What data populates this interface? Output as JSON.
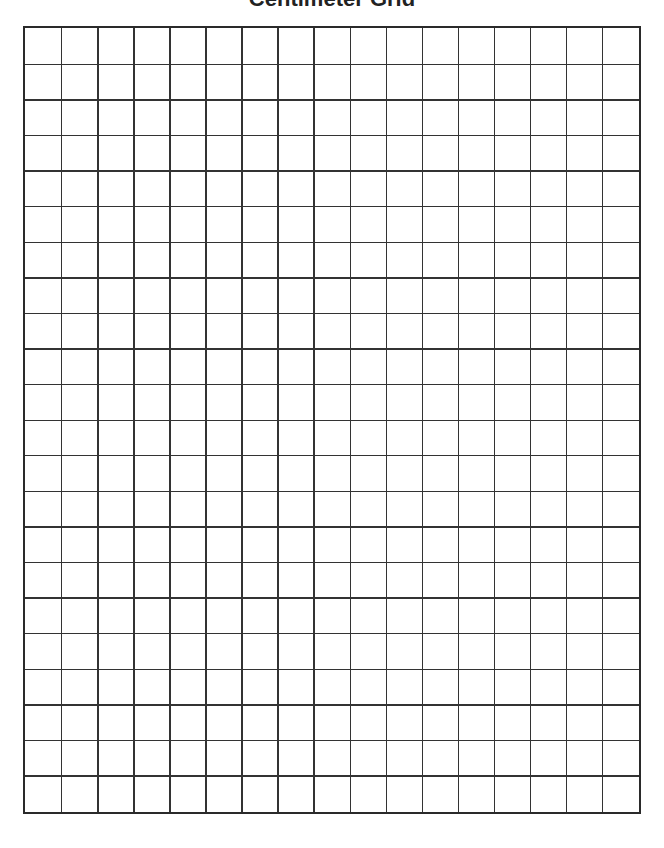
{
  "document": {
    "title": "Centimeter Grid",
    "grid": {
      "columns": 17,
      "rows": 22,
      "line_color": "#333333",
      "border_color": "#2a2a2a"
    }
  }
}
